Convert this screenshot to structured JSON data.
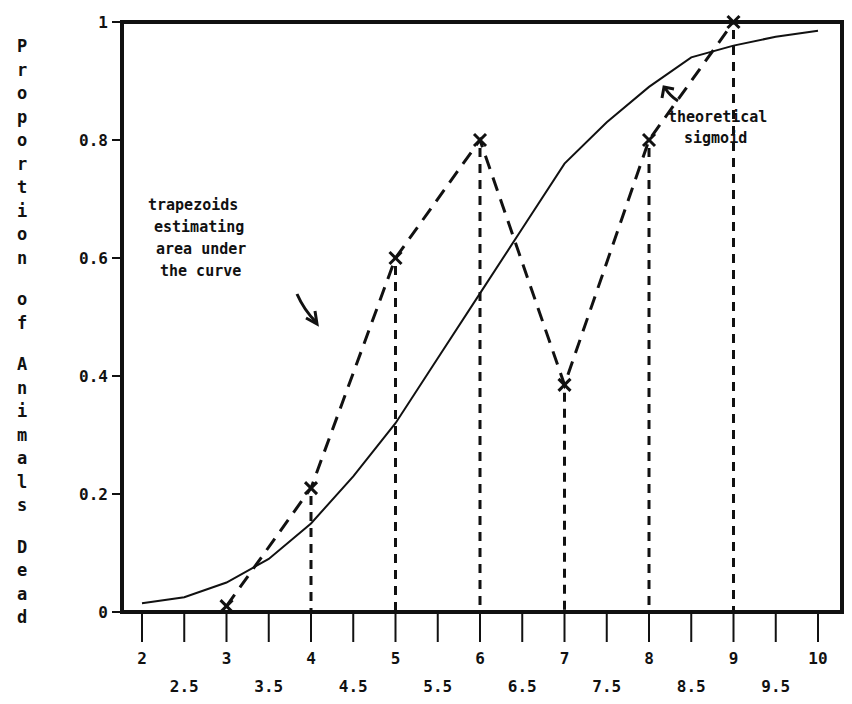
{
  "chart_data": {
    "type": "line",
    "title": "",
    "xlabel": "",
    "ylabel": "Proportion of Animals Dead",
    "xlim": [
      2,
      10
    ],
    "ylim": [
      0,
      1
    ],
    "grid": false,
    "legend": null,
    "x_ticks_major": [
      "2",
      "3",
      "4",
      "5",
      "6",
      "7",
      "8",
      "9",
      "10"
    ],
    "x_ticks_minor": [
      "2.5",
      "3.5",
      "4.5",
      "5.5",
      "6.5",
      "7.5",
      "8.5",
      "9.5"
    ],
    "y_ticks": [
      "0",
      "0.2",
      "0.4",
      "0.6",
      "0.8",
      "1"
    ],
    "series": [
      {
        "name": "observed proportions (trapezoid tops)",
        "style": "dashed with x markers",
        "x": [
          3,
          4,
          5,
          6,
          7,
          8,
          9
        ],
        "y": [
          0.01,
          0.21,
          0.6,
          0.8,
          0.385,
          0.8,
          1.0
        ]
      },
      {
        "name": "theoretical sigmoid",
        "style": "solid",
        "x": [
          2,
          2.5,
          3,
          3.5,
          4,
          4.5,
          5,
          5.5,
          6,
          6.5,
          7,
          7.5,
          8,
          8.5,
          9,
          9.5,
          10
        ],
        "y": [
          0.015,
          0.025,
          0.05,
          0.09,
          0.15,
          0.23,
          0.32,
          0.43,
          0.54,
          0.65,
          0.76,
          0.83,
          0.89,
          0.94,
          0.96,
          0.975,
          0.985
        ]
      }
    ],
    "vertical_dashed_lines_at_x": [
      4,
      5,
      6,
      7,
      8,
      9
    ],
    "annotations": [
      {
        "text": [
          "trapezoids",
          "estimating",
          "area under",
          "the curve"
        ],
        "arrow": "down-right"
      },
      {
        "text": [
          "theoretical",
          "sigmoid"
        ],
        "arrow": "up-left"
      }
    ]
  }
}
